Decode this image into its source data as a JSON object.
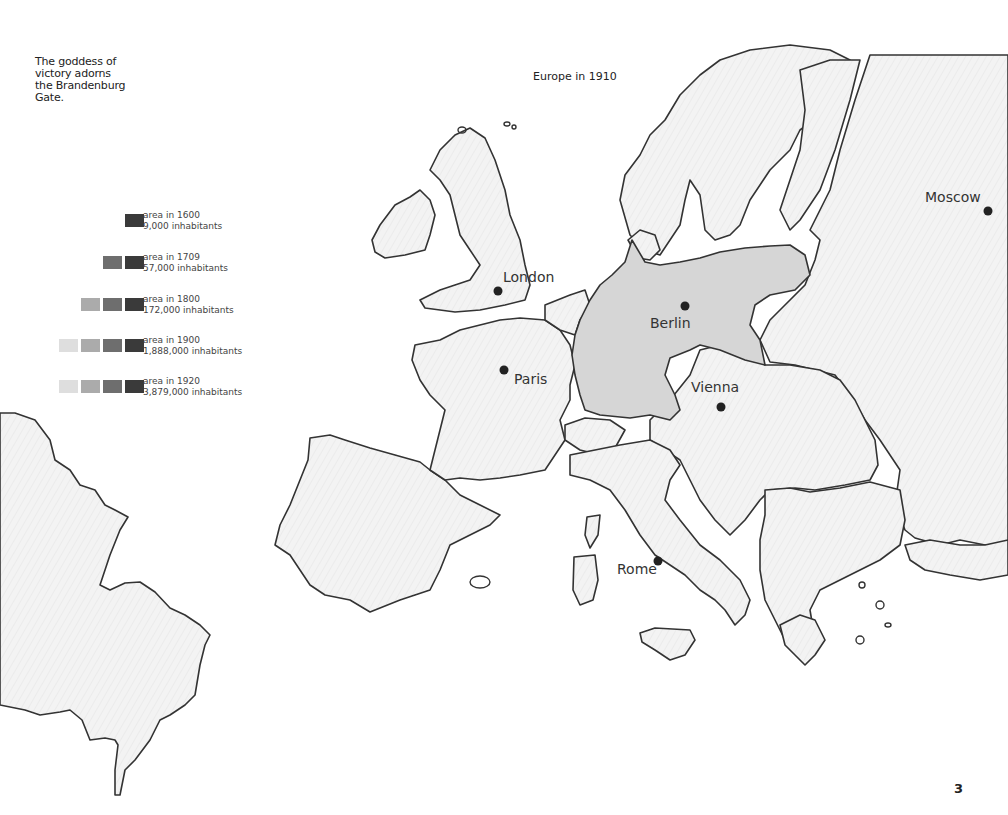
{
  "caption": {
    "lines": [
      "The goddess of",
      "victory adorns",
      "the Brandenburg",
      "Gate."
    ]
  },
  "map": {
    "title": "Europe in 1910",
    "highlight_color": "#d6d6d6",
    "land_color": "#f4f4f4",
    "outline_color": "#333333",
    "cities": [
      {
        "name": "London",
        "dot": [
          498,
          291
        ],
        "label": [
          503,
          270
        ]
      },
      {
        "name": "Paris",
        "dot": [
          504,
          370
        ],
        "label": [
          514,
          372
        ]
      },
      {
        "name": "Berlin",
        "dot": [
          685,
          306
        ],
        "label": [
          650,
          316
        ]
      },
      {
        "name": "Vienna",
        "dot": [
          721,
          407
        ],
        "label": [
          692,
          380
        ]
      },
      {
        "name": "Rome",
        "dot": [
          658,
          561
        ],
        "label": [
          617,
          562
        ]
      },
      {
        "name": "Moscow",
        "dot": [
          988,
          211
        ],
        "label": [
          925,
          190
        ]
      }
    ]
  },
  "legend": {
    "title": "Berlin growth",
    "swatch_colors": [
      "#3a3a3a",
      "#6e6e6e",
      "#ababab",
      "#dedede"
    ],
    "items": [
      {
        "year_label": "area in 1600",
        "population": "9,000 inhabitants",
        "swatches": 1
      },
      {
        "year_label": "area in 1709",
        "population": "57,000 inhabitants",
        "swatches": 2
      },
      {
        "year_label": "area in 1800",
        "population": "172,000 inhabitants",
        "swatches": 3
      },
      {
        "year_label": "area in 1900",
        "population": "1,888,000 inhabitants",
        "swatches": 4
      },
      {
        "year_label": "area in 1920",
        "population": "3,879,000 inhabitants",
        "swatches": 4
      }
    ]
  },
  "page": {
    "number": "3"
  }
}
